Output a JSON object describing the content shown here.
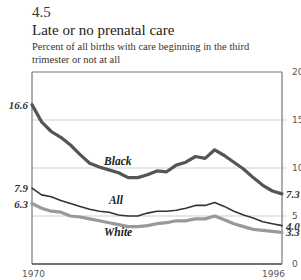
{
  "header": {
    "figure_number": "4.5",
    "title": "Late or no prenatal care",
    "subtitle": "Percent of all births with care beginning in the third trimester or not at all"
  },
  "chart_data": {
    "type": "line",
    "title": "Late or no prenatal care",
    "subtitle": "Percent of all births with care beginning in the third trimester or not at all",
    "xlabel": "",
    "ylabel": "",
    "x": [
      1970,
      1971,
      1972,
      1973,
      1974,
      1975,
      1976,
      1977,
      1978,
      1979,
      1980,
      1981,
      1982,
      1983,
      1984,
      1985,
      1986,
      1987,
      1988,
      1989,
      1990,
      1991,
      1992,
      1993,
      1994,
      1995,
      1996
    ],
    "x_tick_labels": [
      "1970",
      "1996"
    ],
    "y_ticks": [
      0,
      5,
      10,
      15,
      20
    ],
    "ylim": [
      0,
      20
    ],
    "y_axis_position": "right",
    "grid": "horizontal",
    "series": [
      {
        "name": "Black",
        "color": "#555555",
        "width": 3.2,
        "start_label": "16.6",
        "end_label": "7.3",
        "values": [
          16.6,
          14.8,
          13.8,
          13.2,
          12.4,
          11.4,
          10.5,
          10.1,
          9.8,
          9.5,
          9.0,
          9.0,
          9.3,
          9.7,
          9.6,
          10.3,
          10.6,
          11.2,
          11.0,
          11.9,
          11.3,
          10.6,
          9.9,
          9.0,
          8.2,
          7.6,
          7.3
        ]
      },
      {
        "name": "All",
        "color": "#333333",
        "width": 1.6,
        "start_label": "7.9",
        "end_label": "4.0",
        "values": [
          7.9,
          7.2,
          7.0,
          6.6,
          6.3,
          6.0,
          5.7,
          5.5,
          5.4,
          5.1,
          5.0,
          5.0,
          5.3,
          5.5,
          5.5,
          5.6,
          5.8,
          6.1,
          6.1,
          6.4,
          6.0,
          5.5,
          5.1,
          4.8,
          4.4,
          4.2,
          4.0
        ]
      },
      {
        "name": "White",
        "color": "#999999",
        "width": 3.2,
        "start_label": "6.3",
        "end_label": "3.3",
        "values": [
          6.3,
          5.8,
          5.5,
          5.4,
          5.0,
          4.9,
          4.7,
          4.5,
          4.3,
          4.1,
          3.9,
          3.9,
          4.0,
          4.2,
          4.3,
          4.5,
          4.5,
          4.7,
          4.7,
          5.0,
          4.6,
          4.2,
          3.9,
          3.6,
          3.5,
          3.4,
          3.3
        ]
      }
    ],
    "series_label_positions": {
      "Black": {
        "x": 1977.5,
        "y": 10.3
      },
      "All": {
        "x": 1978,
        "y": 6.2
      },
      "White": {
        "x": 1977.5,
        "y": 2.9
      }
    }
  }
}
